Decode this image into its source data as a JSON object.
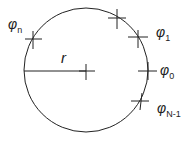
{
  "diagram": {
    "labels": {
      "radius": "r",
      "phi_n": "φ",
      "phi_n_sub": "n",
      "phi_1": "φ",
      "phi_1_sub": "1",
      "phi_0": "φ",
      "phi_0_sub": "0",
      "phi_N1": "φ",
      "phi_N1_sub": "N-1"
    },
    "colors": {
      "stroke": "#222222"
    }
  }
}
